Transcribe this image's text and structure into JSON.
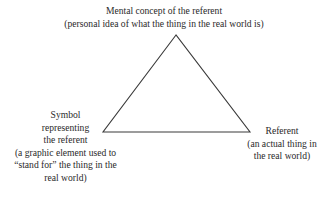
{
  "diagram": {
    "type": "semiotic-triangle",
    "line_color": "#3a3a3a",
    "top_node": {
      "lines": [
        "Mental concept of the referent",
        "(personal idea of what the thing in the real world is)"
      ]
    },
    "left_node": {
      "lines": [
        "Symbol",
        "representing",
        "the referent",
        "(a graphic element used to",
        "“stand for” the thing in the",
        "real world)"
      ]
    },
    "right_node": {
      "lines": [
        "Referent",
        "(an actual thing in",
        "the real world)"
      ]
    }
  }
}
